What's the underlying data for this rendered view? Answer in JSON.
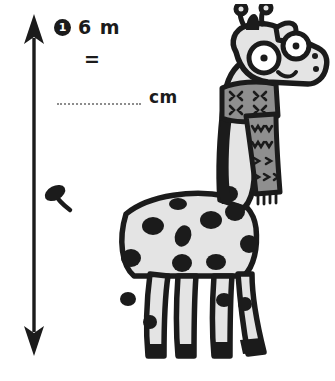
{
  "exercise": {
    "number": "1",
    "quantity": "6 m",
    "equals_symbol": "=",
    "answer_blank": "",
    "unit": "cm"
  },
  "measurement_arrow": {
    "name": "height-measure-arrow",
    "orientation": "vertical",
    "heads": "both",
    "color": "#1b1b1b"
  },
  "illustration": {
    "subject": "giraffe",
    "description": "cartoon giraffe wearing a knitted scarf",
    "colors": {
      "outline": "#1b1b1b",
      "body": "#e4e4e4",
      "spots": "#1b1b1b",
      "scarf": "#8f8f8f",
      "scarf_pattern": "#1b1b1b",
      "eye_white": "#ffffff",
      "mane": "#1b1b1b"
    }
  }
}
